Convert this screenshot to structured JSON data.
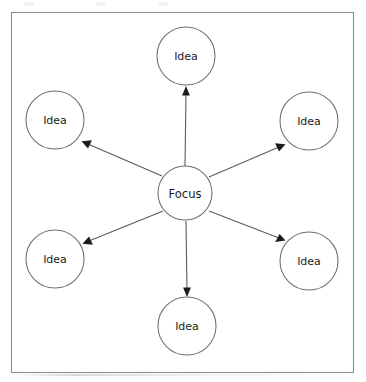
{
  "diagram": {
    "type": "mind-map",
    "frame": {
      "x": 11,
      "y": 12,
      "width": 343,
      "height": 361,
      "stroke_color": "#8c8c8c",
      "fill_color": "#ffffff"
    },
    "style": {
      "node_stroke_color": "#6e6e6e",
      "node_fill_color": "#ffffff",
      "connector_color": "#5b5b5b",
      "arrow_head_color": "#1c1c1c",
      "label_color": "#1a1a1a"
    },
    "center_node": {
      "id": "focus",
      "label": "Focus",
      "cx": 185,
      "cy": 193,
      "r": 27
    },
    "nodes": [
      {
        "id": "idea-top",
        "label": "Idea",
        "cx": 186,
        "cy": 56,
        "r": 29,
        "position": "top"
      },
      {
        "id": "idea-top-left",
        "label": "Idea",
        "cx": 55,
        "cy": 120,
        "r": 29,
        "position": "top-left"
      },
      {
        "id": "idea-top-right",
        "label": "Idea",
        "cx": 309,
        "cy": 121,
        "r": 29,
        "position": "top-right"
      },
      {
        "id": "idea-bottom-left",
        "label": "Idea",
        "cx": 55,
        "cy": 259,
        "r": 29,
        "position": "bottom-left"
      },
      {
        "id": "idea-bottom-right",
        "label": "Idea",
        "cx": 309,
        "cy": 261,
        "r": 29,
        "position": "bottom-right"
      },
      {
        "id": "idea-bottom",
        "label": "Idea",
        "cx": 187,
        "cy": 326,
        "r": 29,
        "position": "bottom"
      }
    ],
    "connectors": [
      {
        "id": "focus-to-idea-top",
        "from": "focus",
        "to": "idea-top",
        "x1": 185,
        "y1": 166,
        "x2": 186,
        "y2": 88,
        "arrow_at": "to"
      },
      {
        "id": "focus-to-idea-top-left",
        "from": "focus",
        "to": "idea-top-left",
        "x1": 162,
        "y1": 176,
        "x2": 83,
        "y2": 142,
        "arrow_at": "to"
      },
      {
        "id": "focus-to-idea-top-right",
        "from": "focus",
        "to": "idea-top-right",
        "x1": 209,
        "y1": 177,
        "x2": 283,
        "y2": 144,
        "arrow_at": "to"
      },
      {
        "id": "focus-to-idea-bottom-left",
        "from": "focus",
        "to": "idea-bottom-left",
        "x1": 163,
        "y1": 211,
        "x2": 84,
        "y2": 243,
        "arrow_at": "to"
      },
      {
        "id": "focus-to-idea-bottom-right",
        "from": "focus",
        "to": "idea-bottom-right",
        "x1": 209,
        "y1": 211,
        "x2": 283,
        "y2": 240,
        "arrow_at": "to"
      },
      {
        "id": "focus-to-idea-bottom",
        "from": "focus",
        "to": "idea-bottom",
        "x1": 186,
        "y1": 221,
        "x2": 187,
        "y2": 295,
        "arrow_at": "to"
      }
    ],
    "top_artifacts": [
      {
        "left": 24,
        "width": 10
      },
      {
        "left": 96,
        "width": 9
      },
      {
        "left": 159,
        "width": 9
      }
    ]
  }
}
